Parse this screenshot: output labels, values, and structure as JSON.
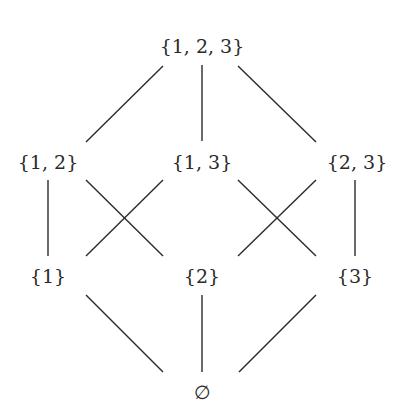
{
  "diagram": {
    "type": "hasse-diagram",
    "nodes": [
      {
        "id": "top",
        "label": "{1, 2, 3}",
        "x": 202,
        "y": 46
      },
      {
        "id": "s12",
        "label": "{1, 2}",
        "x": 48,
        "y": 162
      },
      {
        "id": "s13",
        "label": "{1, 3}",
        "x": 202,
        "y": 162
      },
      {
        "id": "s23",
        "label": "{2, 3}",
        "x": 357,
        "y": 162
      },
      {
        "id": "s1",
        "label": "{1}",
        "x": 48,
        "y": 276
      },
      {
        "id": "s2",
        "label": "{2}",
        "x": 202,
        "y": 276
      },
      {
        "id": "s3",
        "label": "{3}",
        "x": 355,
        "y": 276
      },
      {
        "id": "empty",
        "label": "∅",
        "x": 202,
        "y": 392
      }
    ],
    "edges": [
      {
        "from": "top",
        "to": "s12",
        "x1": 163,
        "y1": 66,
        "x2": 86,
        "y2": 142
      },
      {
        "from": "top",
        "to": "s13",
        "x1": 202,
        "y1": 65,
        "x2": 202,
        "y2": 141
      },
      {
        "from": "top",
        "to": "s23",
        "x1": 238,
        "y1": 66,
        "x2": 316,
        "y2": 142
      },
      {
        "from": "s12",
        "to": "s1",
        "x1": 48,
        "y1": 180,
        "x2": 48,
        "y2": 256
      },
      {
        "from": "s12",
        "to": "s2",
        "x1": 86,
        "y1": 180,
        "x2": 163,
        "y2": 256
      },
      {
        "from": "s13",
        "to": "s1",
        "x1": 163,
        "y1": 180,
        "x2": 86,
        "y2": 256
      },
      {
        "from": "s13",
        "to": "s3",
        "x1": 238,
        "y1": 180,
        "x2": 316,
        "y2": 256
      },
      {
        "from": "s23",
        "to": "s2",
        "x1": 316,
        "y1": 180,
        "x2": 238,
        "y2": 256
      },
      {
        "from": "s23",
        "to": "s3",
        "x1": 355,
        "y1": 180,
        "x2": 355,
        "y2": 256
      },
      {
        "from": "s1",
        "to": "empty",
        "x1": 86,
        "y1": 295,
        "x2": 163,
        "y2": 372
      },
      {
        "from": "s2",
        "to": "empty",
        "x1": 202,
        "y1": 295,
        "x2": 202,
        "y2": 372
      },
      {
        "from": "s3",
        "to": "empty",
        "x1": 316,
        "y1": 295,
        "x2": 239,
        "y2": 372
      }
    ],
    "line_color": "#2a2a2a"
  }
}
